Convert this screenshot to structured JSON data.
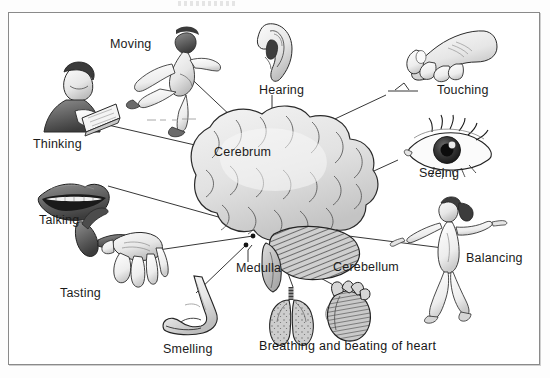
{
  "figure": {
    "background_color": "#ffffff",
    "border_color": "#8a8a8a",
    "ink_color": "#1b1b1b"
  },
  "brain_parts": [
    {
      "id": "cerebrum",
      "label": "Cerebrum",
      "x": 214,
      "y": 152
    },
    {
      "id": "medulla",
      "label": "Medulla",
      "x": 236,
      "y": 268
    },
    {
      "id": "cerebellum",
      "label": "Cerebellum",
      "x": 333,
      "y": 267
    }
  ],
  "functions": [
    {
      "id": "moving",
      "label": "Moving",
      "x": 110,
      "y": 39,
      "illustration": "running-figure"
    },
    {
      "id": "hearing",
      "label": "Hearing",
      "x": 259,
      "y": 84,
      "illustration": "ear"
    },
    {
      "id": "touching",
      "label": "Touching",
      "x": 437,
      "y": 85,
      "illustration": "hand-pinching"
    },
    {
      "id": "thinking",
      "label": "Thinking",
      "x": 33,
      "y": 138,
      "illustration": "person-reading-book"
    },
    {
      "id": "seeing",
      "label": "Seeing",
      "x": 419,
      "y": 168,
      "illustration": "eye"
    },
    {
      "id": "talking",
      "label": "Talking",
      "x": 39,
      "y": 215,
      "illustration": "lips"
    },
    {
      "id": "balancing",
      "label": "Balancing",
      "x": 466,
      "y": 253,
      "illustration": "balancing-figure"
    },
    {
      "id": "tasting",
      "label": "Tasting",
      "x": 60,
      "y": 288,
      "illustration": "tongue-and-hand"
    },
    {
      "id": "smelling",
      "label": "Smelling",
      "x": 163,
      "y": 344,
      "illustration": "nose"
    }
  ],
  "caption": {
    "text": "Breathing and beating of heart",
    "x": 259,
    "y": 345,
    "illustrations": [
      "lungs",
      "heart"
    ]
  },
  "top_artifact": {
    "present": true,
    "description": "faint scan artifact"
  }
}
